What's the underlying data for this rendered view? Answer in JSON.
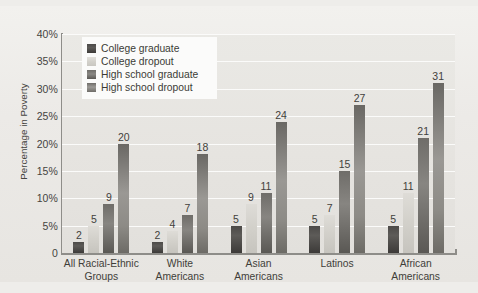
{
  "chart_data": {
    "type": "bar",
    "title": "",
    "xlabel": "",
    "ylabel": "Percentage in Poverty",
    "ylim": [
      0,
      40
    ],
    "ytick_labels": [
      "0",
      "5%",
      "10%",
      "15%",
      "20%",
      "25%",
      "30%",
      "35%",
      "40%"
    ],
    "ytick_values": [
      0,
      5,
      10,
      15,
      20,
      25,
      30,
      35,
      40
    ],
    "grid": true,
    "legend_position": "upper-left-inside",
    "categories": [
      "All Racial-Ethnic Groups",
      "White Americans",
      "Asian Americans",
      "Latinos",
      "African Americans"
    ],
    "category_lines": [
      [
        "All Racial-Ethnic",
        "Groups"
      ],
      [
        "White",
        "Americans"
      ],
      [
        "Asian",
        "Americans"
      ],
      [
        "Latinos",
        ""
      ],
      [
        "African",
        "Americans"
      ]
    ],
    "series": [
      {
        "name": "College graduate",
        "color": "#4c4a48",
        "values": [
          2,
          2,
          5,
          5,
          5
        ]
      },
      {
        "name": "College dropout",
        "color": "#d6d4ce",
        "values": [
          5,
          4,
          9,
          7,
          11
        ]
      },
      {
        "name": "High school graduate",
        "color": "#6f6d69",
        "values": [
          9,
          7,
          11,
          15,
          21
        ]
      },
      {
        "name": "High school dropout",
        "color": "#8e8c88",
        "values": [
          20,
          18,
          24,
          27,
          31
        ]
      }
    ]
  },
  "legend": {
    "items": [
      {
        "label": "College graduate"
      },
      {
        "label": "College dropout"
      },
      {
        "label": "High school graduate"
      },
      {
        "label": "High school dropout"
      }
    ]
  },
  "caption": {
    "text": ""
  }
}
